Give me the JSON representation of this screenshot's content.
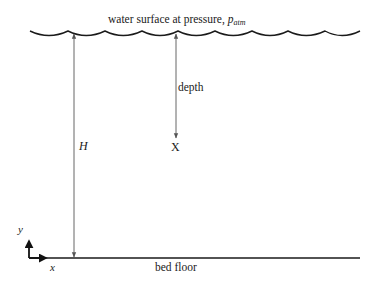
{
  "diagram": {
    "surface_label_prefix": "water surface at pressure, ",
    "surface_label_symbol": "p",
    "surface_label_subscript": "atm",
    "depth_label": "depth",
    "point_label": "X",
    "height_label": "H",
    "floor_label": "bed floor",
    "axis_y_label": "y",
    "axis_x_label": "x"
  },
  "colors": {
    "stroke": "#1a1a1a",
    "dimension_line": "#555555",
    "background": "#ffffff"
  }
}
